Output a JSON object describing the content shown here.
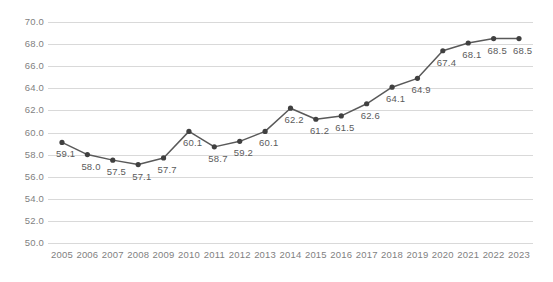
{
  "chart_data": {
    "type": "line",
    "title": "",
    "subtitle": "",
    "xlabel": "",
    "ylabel": "",
    "categories": [
      "2005",
      "2006",
      "2007",
      "2008",
      "2009",
      "2010",
      "2011",
      "2012",
      "2013",
      "2014",
      "2015",
      "2016",
      "2017",
      "2018",
      "2019",
      "2020",
      "2021",
      "2022",
      "2023"
    ],
    "values": [
      59.1,
      58.0,
      57.5,
      57.1,
      57.7,
      60.1,
      58.7,
      59.2,
      60.1,
      62.2,
      61.2,
      61.5,
      62.6,
      64.1,
      64.9,
      67.4,
      68.1,
      68.5,
      68.5
    ],
    "data_labels": [
      "59.1",
      "58.0",
      "57.5",
      "57.1",
      "57.7",
      "60.1",
      "58.7",
      "59.2",
      "60.1",
      "62.2",
      "61.2",
      "61.5",
      "62.6",
      "64.1",
      "64.9",
      "67.4",
      "68.1",
      "68.5",
      "68.5"
    ],
    "ylim": [
      50.0,
      70.0
    ],
    "ytick_step": 2.0,
    "ytick_labels": [
      "70.0",
      "68.0",
      "66.0",
      "64.0",
      "62.0",
      "60.0",
      "58.0",
      "56.0",
      "54.0",
      "52.0",
      "50.0"
    ],
    "ytick_values": [
      70.0,
      68.0,
      66.0,
      64.0,
      62.0,
      60.0,
      58.0,
      56.0,
      54.0,
      52.0,
      50.0
    ],
    "grid": true,
    "grid_axis": "y",
    "legend": false,
    "legend_position": "none",
    "series": [
      {
        "name": "series-1",
        "values": [
          59.1,
          58.0,
          57.5,
          57.1,
          57.7,
          60.1,
          58.7,
          59.2,
          60.1,
          62.2,
          61.2,
          61.5,
          62.6,
          64.1,
          64.9,
          67.4,
          68.1,
          68.5,
          68.5
        ]
      }
    ]
  },
  "style": {
    "line_color": "#595959",
    "marker_color": "#404040",
    "grid_color": "#d9d9d9",
    "tick_label_color": "#7f7f7f",
    "data_label_color": "#5b5b5b",
    "background": "#ffffff"
  }
}
